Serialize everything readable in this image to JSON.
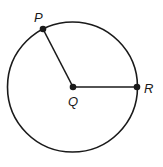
{
  "diagram": {
    "type": "circle-geometry",
    "circle": {
      "center": "Q",
      "cx": 72.5,
      "cy": 87,
      "r": 65
    },
    "points": [
      {
        "label": "P",
        "x": 43,
        "y": 29,
        "label_x": 34,
        "label_y": 22
      },
      {
        "label": "Q",
        "x": 73,
        "y": 87,
        "label_x": 68,
        "label_y": 106
      },
      {
        "label": "R",
        "x": 137,
        "y": 87,
        "label_x": 144,
        "label_y": 93
      }
    ],
    "segments": [
      {
        "from": "Q",
        "to": "P"
      },
      {
        "from": "Q",
        "to": "R"
      }
    ],
    "colors": {
      "stroke": "#1a1a1a",
      "background": "#ffffff"
    }
  }
}
